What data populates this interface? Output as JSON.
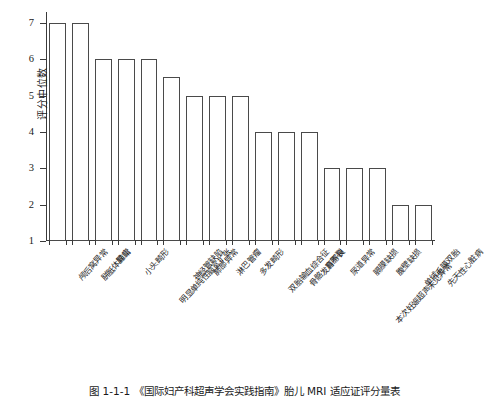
{
  "chart_data": {
    "type": "bar",
    "title": "",
    "xlabel": "",
    "ylabel": "评分中位数",
    "ylim": [
      1,
      7.3
    ],
    "yticks": [
      1,
      2,
      3,
      4,
      5,
      6,
      7
    ],
    "grid": false,
    "legend": null,
    "categories": [
      "颅后窝异常",
      "胼胝体异常",
      "脑疝",
      "小头畸形",
      "明显单纯性脑室扩张",
      "神经管缺陷",
      "肺部异常",
      "淋巴管瘤",
      "多发畸形",
      "双胎输血综合征",
      "骨骼发育不良",
      "唇腭裂",
      "尿道异常",
      "膈膜缺损",
      "腹壁缺损",
      "单绒毛膜双胎",
      "先天性心脏病"
    ],
    "values": [
      7,
      7,
      6,
      6,
      6,
      5.5,
      5,
      5,
      5,
      4,
      4,
      4,
      3,
      3,
      3,
      2,
      2
    ],
    "extra_annotation": "本次妊娠超声未见异常"
  },
  "axis": {
    "y_title": "评分中位数",
    "y_tick_labels": [
      "7",
      "6",
      "5",
      "4",
      "3",
      "2",
      "1"
    ]
  },
  "caption": {
    "text": "图 1-1-1  《国际妇产科超声学会实践指南》胎儿 MRI 适应证评分量表"
  }
}
